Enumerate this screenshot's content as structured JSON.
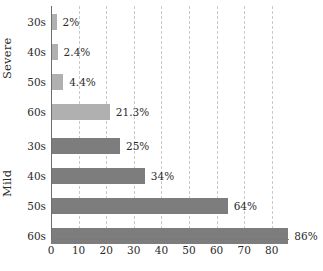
{
  "chart_data": {
    "type": "bar",
    "orientation": "horizontal",
    "title": "",
    "xlabel": "",
    "ylabel": "",
    "xlim": [
      0,
      86
    ],
    "xticks": [
      0,
      10,
      20,
      30,
      40,
      50,
      60,
      70,
      80
    ],
    "xtick_labels": [
      "0",
      "10",
      "20",
      "30",
      "40",
      "50",
      "60",
      "70",
      "80"
    ],
    "grid": true,
    "grid_axis": "x",
    "grid_style": "dashed",
    "legend": false,
    "groups": [
      {
        "name": "Severe",
        "color": "#b0b0b0",
        "categories": [
          "30s",
          "40s",
          "50s",
          "60s"
        ],
        "values": [
          2,
          2.4,
          4.4,
          21.3
        ],
        "value_labels": [
          "2%",
          "2.4%",
          "4.4%",
          "21.3%"
        ]
      },
      {
        "name": "Mild",
        "color": "#7d7d7d",
        "categories": [
          "30s",
          "40s",
          "50s",
          "60s"
        ],
        "values": [
          25,
          34,
          64,
          86
        ],
        "value_labels": [
          "25%",
          "34%",
          "64%",
          "86%"
        ]
      }
    ],
    "categories": [
      "30s",
      "40s",
      "50s",
      "60s",
      "30s",
      "40s",
      "50s",
      "60s"
    ],
    "values": [
      2,
      2.4,
      4.4,
      21.3,
      25,
      34,
      64,
      86
    ],
    "value_labels": [
      "2%",
      "2.4%",
      "4.4%",
      "21.3%",
      "25%",
      "34%",
      "64%",
      "86%"
    ],
    "colors": [
      "#b0b0b0",
      "#b0b0b0",
      "#b0b0b0",
      "#b0b0b0",
      "#7d7d7d",
      "#7d7d7d",
      "#7d7d7d",
      "#7d7d7d"
    ]
  },
  "axis": {
    "group_labels": [
      "Severe",
      "Mild"
    ],
    "gridline_color": "#c9c9c9",
    "axis_color": "#6e6e6e"
  }
}
